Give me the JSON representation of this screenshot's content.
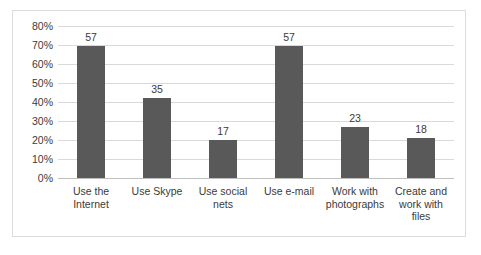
{
  "chart_data": {
    "type": "bar",
    "title": "",
    "subtitle": "",
    "xlabel": "",
    "ylabel": "",
    "categories": [
      "Use the Internet",
      "Use Skype",
      "Use social nets",
      "Use e-mail",
      "Work with photographs",
      "Create and work with files"
    ],
    "category_lines": [
      [
        "Use the",
        "Internet"
      ],
      [
        "Use Skype"
      ],
      [
        "Use social",
        "nets"
      ],
      [
        "Use e-mail"
      ],
      [
        "Work with",
        "photographs"
      ],
      [
        "Create and",
        "work with",
        "files"
      ]
    ],
    "values": [
      69.5,
      42,
      20,
      69.5,
      27,
      21
    ],
    "data_labels": [
      "57",
      "35",
      "17",
      "57",
      "23",
      "18"
    ],
    "ylim": [
      0,
      80
    ],
    "ytick_labels": [
      "80%",
      "70%",
      "60%",
      "50%",
      "40%",
      "30%",
      "20%",
      "10%",
      "0%"
    ],
    "ytick_values": [
      80,
      70,
      60,
      50,
      40,
      30,
      20,
      10,
      0
    ],
    "grid": true,
    "legend": false,
    "legend_position": "none",
    "colors": {
      "bar": "#595959",
      "gridline": "#d9d9d9",
      "axis": "#bfbfbf",
      "text": "#3a3a3a",
      "frame": "#dcdcdc",
      "background": "#ffffff"
    }
  }
}
